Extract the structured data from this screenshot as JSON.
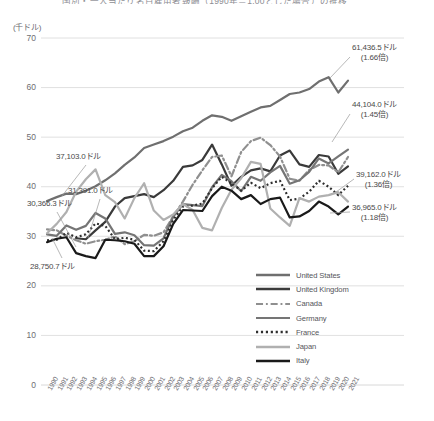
{
  "title_partial": "国別・一人当たり名目雇用者報酬（1990年＝1.00とした場合）の推移",
  "axis": {
    "y_unit": "(千ドル)",
    "y_ticks": [
      0,
      10,
      20,
      30,
      40,
      50,
      60,
      70
    ],
    "y_min": 0,
    "y_max": 70,
    "x_min": 1990,
    "x_max": 2021
  },
  "legend": {
    "position": "inside-bottom-right",
    "items": [
      {
        "label": "United States",
        "color": "#6f6f6f",
        "style": "solid",
        "width": 2.4
      },
      {
        "label": "United Kingdom",
        "color": "#3a3a3a",
        "style": "solid",
        "width": 2.4
      },
      {
        "label": "Canada",
        "color": "#8f8f8f",
        "style": "dash-dot",
        "width": 2.2
      },
      {
        "label": "Germany",
        "color": "#757575",
        "style": "solid",
        "width": 2.2
      },
      {
        "label": "France",
        "color": "#2e2e2e",
        "style": "dotted",
        "width": 2.4
      },
      {
        "label": "Japan",
        "color": "#b0b0b0",
        "style": "solid",
        "width": 2.4
      },
      {
        "label": "Italy",
        "color": "#1a1a1a",
        "style": "solid",
        "width": 2.4
      }
    ]
  },
  "annotations": [
    {
      "name": "label-us-start",
      "text1": "37,103.0ドル",
      "text2": "",
      "x": 56,
      "y": 152
    },
    {
      "name": "label-ca-start",
      "text1": "31,391.0ドル",
      "text2": "",
      "x": 68,
      "y": 186
    },
    {
      "name": "label-de-start",
      "text1": "30,366.3ドル",
      "text2": "",
      "x": 27,
      "y": 199
    },
    {
      "name": "label-it-start",
      "text1": "28,750.7ドル",
      "text2": "",
      "x": 30,
      "y": 262
    },
    {
      "name": "label-us-end",
      "text1": "61,436.5ドル",
      "text2": "(1.66倍)",
      "x": 352,
      "y": 43
    },
    {
      "name": "label-uk-end",
      "text1": "44,104.0ドル",
      "text2": "(1.45倍)",
      "x": 352,
      "y": 100
    },
    {
      "name": "label-ca-end",
      "text1": "39,162.0ドル",
      "text2": "(1.36倍)",
      "x": 356,
      "y": 170
    },
    {
      "name": "label-fr-end",
      "text1": "36,965.0ドル",
      "text2": "(1.18倍)",
      "x": 352,
      "y": 203
    }
  ],
  "chart_data": {
    "type": "line",
    "xlabel": "",
    "ylabel": "(千ドル)",
    "ylim": [
      0,
      70
    ],
    "xlim": [
      1990,
      2021
    ],
    "grid": true,
    "legend_position": "inside-bottom-right",
    "x": [
      1990,
      1991,
      1992,
      1993,
      1994,
      1995,
      1996,
      1997,
      1998,
      1999,
      2000,
      2001,
      2002,
      2003,
      2004,
      2005,
      2006,
      2007,
      2008,
      2009,
      2010,
      2011,
      2012,
      2013,
      2014,
      2015,
      2016,
      2017,
      2018,
      2019,
      2020,
      2021
    ],
    "series": [
      {
        "name": "United States",
        "color": "#6f6f6f",
        "style": "solid",
        "start_value": 37103.0,
        "end_value": 61436.5,
        "ratio": "1.66倍",
        "values": [
          37.1,
          37.9,
          38.6,
          38.5,
          39.2,
          40.1,
          41.3,
          42.7,
          44.4,
          45.9,
          47.8,
          48.5,
          49.2,
          50.1,
          51.2,
          51.9,
          53.3,
          54.4,
          54.1,
          53.3,
          54.2,
          55.1,
          56.0,
          56.3,
          57.5,
          58.7,
          59.0,
          59.7,
          61.2,
          62.1,
          59.0,
          61.4
        ]
      },
      {
        "name": "United Kingdom",
        "color": "#3a3a3a",
        "style": "solid",
        "start_value": null,
        "end_value": 44104.0,
        "ratio": "1.45倍",
        "values": [
          null,
          null,
          null,
          29.6,
          29.4,
          31.2,
          32.9,
          36.0,
          37.7,
          38.1,
          38.5,
          37.9,
          39.3,
          41.2,
          44.0,
          44.3,
          45.4,
          48.5,
          44.5,
          40.2,
          42.0,
          43.3,
          43.7,
          43.1,
          46.3,
          47.3,
          44.5,
          44.0,
          46.4,
          46.1,
          42.6,
          44.1
        ]
      },
      {
        "name": "Canada",
        "color": "#8f8f8f",
        "style": "dash-dot",
        "start_value": 31391.0,
        "end_value": 39162.0,
        "ratio": "1.36倍",
        "values": [
          31.4,
          31.2,
          30.1,
          29.2,
          28.5,
          29.0,
          29.3,
          30.0,
          28.4,
          29.0,
          30.3,
          30.1,
          30.8,
          34.0,
          37.0,
          40.4,
          43.3,
          46.0,
          46.3,
          42.1,
          47.0,
          49.2,
          49.9,
          48.4,
          46.1,
          41.6,
          41.2,
          43.4,
          44.4,
          44.3,
          42.9,
          46.0
        ]
      },
      {
        "name": "Germany",
        "color": "#757575",
        "style": "solid",
        "start_value": 30366.3,
        "end_value": null,
        "ratio": "",
        "values": [
          30.4,
          30.1,
          32.2,
          31.3,
          32.1,
          34.7,
          33.6,
          30.5,
          30.8,
          30.2,
          28.2,
          28.1,
          29.6,
          34.0,
          36.5,
          36.3,
          36.1,
          39.9,
          42.4,
          41.1,
          39.1,
          42.0,
          41.2,
          42.9,
          44.2,
          40.6,
          41.3,
          43.0,
          45.7,
          44.7,
          46.1,
          47.5
        ]
      },
      {
        "name": "France",
        "color": "#2e2e2e",
        "style": "dotted",
        "start_value": null,
        "end_value": 36965.0,
        "ratio": "1.18倍",
        "values": [
          29.2,
          29.3,
          30.7,
          29.8,
          30.4,
          32.6,
          32.1,
          29.4,
          29.7,
          29.3,
          27.1,
          27.0,
          29.0,
          33.3,
          36.0,
          36.2,
          36.6,
          39.7,
          42.0,
          40.7,
          39.2,
          40.8,
          39.7,
          40.7,
          41.2,
          37.3,
          37.6,
          39.0,
          41.2,
          40.0,
          38.3,
          40.2
        ]
      },
      {
        "name": "Japan",
        "color": "#b0b0b0",
        "style": "solid",
        "start_value": null,
        "end_value": null,
        "ratio": "",
        "values": [
          30.6,
          32.5,
          34.9,
          39.0,
          41.5,
          43.5,
          38.3,
          36.9,
          33.6,
          37.7,
          40.7,
          35.2,
          33.3,
          34.4,
          36.5,
          35.3,
          31.7,
          31.2,
          35.7,
          39.4,
          41.7,
          45.0,
          44.6,
          35.6,
          33.8,
          32.1,
          37.7,
          37.0,
          38.0,
          38.3,
          38.9,
          37.0
        ]
      },
      {
        "name": "Italy",
        "color": "#1a1a1a",
        "style": "solid",
        "start_value": 28750.7,
        "end_value": null,
        "ratio": "",
        "values": [
          28.8,
          29.5,
          29.8,
          26.6,
          26.0,
          25.6,
          29.3,
          29.2,
          29.0,
          28.5,
          26.0,
          26.0,
          28.0,
          32.5,
          35.3,
          35.2,
          35.1,
          38.1,
          40.0,
          39.2,
          37.5,
          38.3,
          36.5,
          37.5,
          37.8,
          33.8,
          34.0,
          35.1,
          37.0,
          36.0,
          34.4,
          36.0
        ]
      }
    ]
  },
  "x_tick_labels": [
    "1990",
    "1991",
    "1992",
    "1993",
    "1994",
    "1995",
    "1996",
    "1997",
    "1998",
    "1999",
    "2000",
    "2001",
    "2002",
    "2003",
    "2004",
    "2005",
    "2006",
    "2007",
    "2008",
    "2009",
    "2010",
    "2011",
    "2012",
    "2013",
    "2014",
    "2015",
    "2016",
    "2017",
    "2018",
    "2019",
    "2020",
    "2021"
  ]
}
